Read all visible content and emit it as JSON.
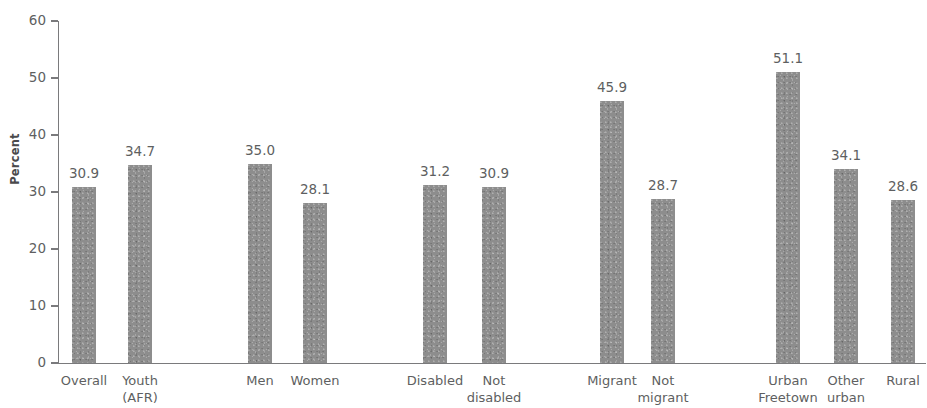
{
  "chart_data": {
    "type": "bar",
    "title": "",
    "subtitle": "",
    "xlabel": "",
    "ylabel": "Percent",
    "ylim": [
      0,
      60
    ],
    "yticks": [
      0,
      10,
      20,
      30,
      40,
      50,
      60
    ],
    "ytick_labels": [
      "0",
      "10",
      "20",
      "30",
      "40",
      "50",
      "60"
    ],
    "grid": false,
    "legend": null,
    "bar_color": "#8d8d8d",
    "axis_color": "#7a7a7c",
    "text_color": "#5e5f61",
    "background_color": "#ffffff",
    "categories": [
      "Overall",
      "Youth\n(AFR)",
      "Men",
      "Women",
      "Disabled",
      "Not\ndisabled",
      "Migrant",
      "Not\nmigrant",
      "Urban\nFreetown",
      "Other\nurban",
      "Rural"
    ],
    "values": [
      30.9,
      34.7,
      35.0,
      28.1,
      31.2,
      30.9,
      45.9,
      28.7,
      51.1,
      34.1,
      28.6
    ],
    "value_labels": [
      "30.9",
      "34.7",
      "35.0",
      "28.1",
      "31.2",
      "30.9",
      "45.9",
      "28.7",
      "51.1",
      "34.1",
      "28.6"
    ],
    "groups": [
      {
        "name": "total",
        "categories": [
          "Overall",
          "Youth (AFR)"
        ]
      },
      {
        "name": "sex",
        "categories": [
          "Men",
          "Women"
        ]
      },
      {
        "name": "disability",
        "categories": [
          "Disabled",
          "Not disabled"
        ]
      },
      {
        "name": "migration",
        "categories": [
          "Migrant",
          "Not migrant"
        ]
      },
      {
        "name": "location",
        "categories": [
          "Urban Freetown",
          "Other urban",
          "Rural"
        ]
      }
    ]
  },
  "bars": [
    {
      "label": "Overall",
      "value_label": "30.9",
      "value": 30.9,
      "x": 72,
      "w": 24
    },
    {
      "label": "Youth\n(AFR)",
      "value_label": "34.7",
      "value": 34.7,
      "x": 128,
      "w": 24
    },
    {
      "label": "Men",
      "value_label": "35.0",
      "value": 35.0,
      "x": 248,
      "w": 24
    },
    {
      "label": "Women",
      "value_label": "28.1",
      "value": 28.1,
      "x": 303,
      "w": 24
    },
    {
      "label": "Disabled",
      "value_label": "31.2",
      "value": 31.2,
      "x": 423,
      "w": 24
    },
    {
      "label": "Not\ndisabled",
      "value_label": "30.9",
      "value": 30.9,
      "x": 482,
      "w": 24
    },
    {
      "label": "Migrant",
      "value_label": "45.9",
      "value": 45.9,
      "x": 600,
      "w": 24
    },
    {
      "label": "Not\nmigrant",
      "value_label": "28.7",
      "value": 28.7,
      "x": 651,
      "w": 24
    },
    {
      "label": "Urban\nFreetown",
      "value_label": "51.1",
      "value": 51.1,
      "x": 776,
      "w": 24
    },
    {
      "label": "Other\nurban",
      "value_label": "34.1",
      "value": 34.1,
      "x": 834,
      "w": 24
    },
    {
      "label": "Rural",
      "value_label": "28.6",
      "value": 28.6,
      "x": 891,
      "w": 24
    }
  ],
  "axis": {
    "y_title": "Percent",
    "ticks": [
      {
        "label": "0",
        "value": 0
      },
      {
        "label": "10",
        "value": 10
      },
      {
        "label": "20",
        "value": 20
      },
      {
        "label": "30",
        "value": 30
      },
      {
        "label": "40",
        "value": 40
      },
      {
        "label": "50",
        "value": 50
      },
      {
        "label": "60",
        "value": 60
      }
    ]
  },
  "geometry": {
    "baseline_y": 363,
    "top_y": 21,
    "px_per_unit": 5.7,
    "axis_x": 58
  }
}
